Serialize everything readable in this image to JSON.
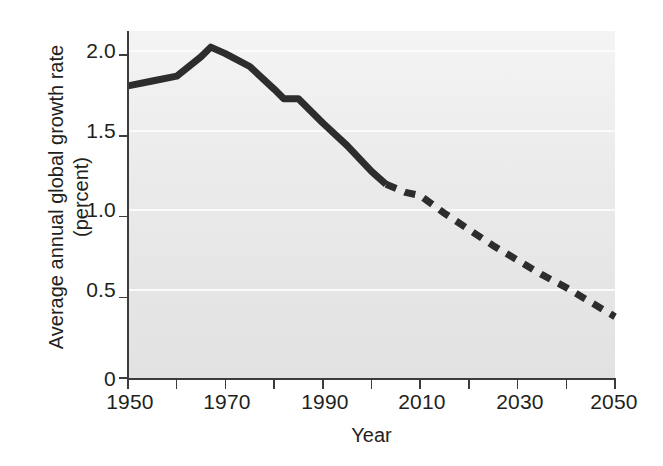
{
  "chart_data": {
    "type": "line",
    "title": "",
    "xlabel": "Year",
    "ylabel": "Average annual global growth rate (percent)",
    "ylabel_line1": "Average annual global growth rate",
    "ylabel_line2": "(percent)",
    "xlim": [
      1950,
      2050
    ],
    "ylim": [
      0,
      2.15
    ],
    "xticks": [
      1950,
      1960,
      1970,
      1980,
      1990,
      2000,
      2010,
      2020,
      2030,
      2040,
      2050
    ],
    "xtick_labels": [
      "1950",
      "",
      "1970",
      "",
      "1990",
      "",
      "2010",
      "",
      "2030",
      "",
      "2050"
    ],
    "xtick_labels_shown": [
      "1950",
      "1970",
      "1990",
      "2010",
      "2030",
      "2050"
    ],
    "yticks": [
      0,
      0.5,
      1.0,
      1.5,
      2.0
    ],
    "ytick_labels": [
      "0",
      "0.5",
      "1.0",
      "1.5",
      "2.0"
    ],
    "grid": "horizontal-white",
    "legend": "none",
    "plot_background": "#ebebeb",
    "line_color": "#2d2d2d",
    "line_width_px": 7,
    "series": [
      {
        "name": "Observed (solid)",
        "style": "solid",
        "x": [
          1950,
          1955,
          1960,
          1965,
          1967,
          1970,
          1975,
          1980,
          1982,
          1985,
          1990,
          1995,
          2000,
          2003
        ],
        "y": [
          1.81,
          1.84,
          1.87,
          1.99,
          2.05,
          2.01,
          1.93,
          1.79,
          1.73,
          1.73,
          1.58,
          1.44,
          1.28,
          1.2
        ]
      },
      {
        "name": "Projected (dashed)",
        "style": "dashed",
        "x": [
          2003,
          2007,
          2010,
          2015,
          2020,
          2025,
          2030,
          2035,
          2040,
          2045,
          2050
        ],
        "y": [
          1.2,
          1.15,
          1.13,
          1.02,
          0.92,
          0.82,
          0.73,
          0.64,
          0.56,
          0.47,
          0.38
        ]
      }
    ],
    "annotations": [
      {
        "text": "Solid line = historical estimates through about 2003"
      },
      {
        "text": "Dashed line = projection from about 2003 to 2050"
      }
    ]
  }
}
